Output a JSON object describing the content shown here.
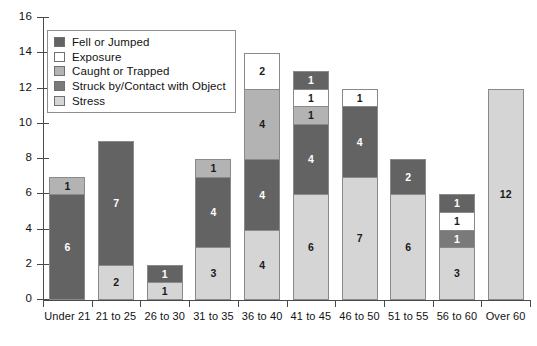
{
  "chart_data": {
    "type": "bar",
    "stacked": true,
    "title": "",
    "subtitle": "",
    "xlabel": "",
    "ylabel": "",
    "ylim": [
      0,
      16
    ],
    "ytick_step": 2,
    "yticks": [
      16,
      14,
      12,
      10,
      8,
      6,
      4,
      2,
      0
    ],
    "grid": false,
    "legend_position": "top-left inside plot",
    "categories": [
      "Under 21",
      "21 to 25",
      "26 to 30",
      "31 to 35",
      "36 to 40",
      "41 to 45",
      "46 to 50",
      "51 to 55",
      "56 to 60",
      "Over 60"
    ],
    "series": [
      {
        "name": "Stress",
        "color": "#d5d5d5",
        "label_color": "dark",
        "values": [
          0,
          2,
          1,
          3,
          4,
          6,
          7,
          6,
          3,
          12
        ]
      },
      {
        "name": "Struck by/Contact with Object",
        "color": "#7a7a7a",
        "label_color": "light",
        "values": [
          0,
          0,
          0,
          0,
          0,
          0,
          0,
          0,
          1,
          0
        ]
      },
      {
        "name": "Fell or Jumped",
        "color": "#636363",
        "label_color": "light",
        "values": [
          6,
          7,
          1,
          4,
          4,
          4,
          4,
          2,
          0,
          0
        ]
      },
      {
        "name": "Caught or Trapped",
        "color": "#b3b3b3",
        "label_color": "dark",
        "values": [
          1,
          0,
          0,
          1,
          4,
          1,
          0,
          0,
          0,
          0
        ]
      },
      {
        "name": "Exposure",
        "color": "#ffffff",
        "label_color": "dark",
        "values": [
          0,
          0,
          0,
          0,
          2,
          1,
          1,
          0,
          1,
          0
        ]
      },
      {
        "name": "Fell or Jumped (top)",
        "color": "#636363",
        "label_color": "light",
        "values": [
          0,
          0,
          0,
          0,
          0,
          1,
          0,
          0,
          1,
          0
        ]
      }
    ],
    "totals": [
      7,
      9,
      2,
      8,
      14,
      13,
      12,
      8,
      6,
      12
    ]
  },
  "legend": {
    "items": [
      {
        "label": "Fell or Jumped",
        "color": "#636363"
      },
      {
        "label": "Exposure",
        "color": "#ffffff"
      },
      {
        "label": "Caught or Trapped",
        "color": "#b3b3b3"
      },
      {
        "label": "Struck by/Contact with Object",
        "color": "#7a7a7a"
      },
      {
        "label": "Stress",
        "color": "#d5d5d5"
      }
    ]
  },
  "axis_colors": {
    "axis_line": "#4a4a4a",
    "bar_border": "#8a8a8a",
    "text": "#111111"
  }
}
